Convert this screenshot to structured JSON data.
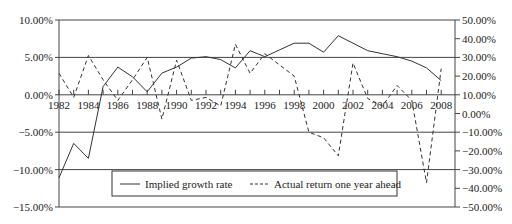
{
  "chart_data": {
    "type": "line",
    "title": "",
    "xlabel": "",
    "ylabel_left": "",
    "ylabel_right": "",
    "x": [
      1982,
      1983,
      1984,
      1985,
      1986,
      1987,
      1988,
      1989,
      1990,
      1991,
      1992,
      1993,
      1994,
      1995,
      1996,
      1997,
      1998,
      1999,
      2000,
      2001,
      2002,
      2003,
      2004,
      2005,
      2006,
      2007,
      2008
    ],
    "x_tick_labels": [
      "1982",
      "1984",
      "1986",
      "1988",
      "1990",
      "1992",
      "1994",
      "1996",
      "1998",
      "2000",
      "2002",
      "2004",
      "2006",
      "2008"
    ],
    "left_axis": {
      "ylim": [
        -15,
        10
      ],
      "tick_values": [
        10,
        5,
        0,
        -5,
        -10,
        -15
      ],
      "tick_labels": [
        "10.00%",
        "5.00%",
        "0.00%",
        "-5.00%",
        "-10.00%",
        "-15.00%"
      ]
    },
    "right_axis": {
      "ylim": [
        -50,
        50
      ],
      "tick_values": [
        50,
        40,
        30,
        20,
        10,
        0,
        -10,
        -20,
        -30,
        -40,
        -50
      ],
      "tick_labels": [
        "50.00%",
        "40.00%",
        "30.00%",
        "20.00%",
        "10.00%",
        "0.00%",
        "-10.00%",
        "-20.00%",
        "-30.00%",
        "-40.00%",
        "-50.00%"
      ]
    },
    "grid": true,
    "legend_position": "bottom-inside",
    "series": [
      {
        "name": "Implied growth rate",
        "axis": "left",
        "style": "solid",
        "values": [
          -11.1,
          -6.5,
          -8.5,
          1.1,
          3.7,
          2.4,
          0.4,
          2.9,
          3.7,
          4.9,
          5.1,
          4.7,
          3.6,
          5.9,
          5.1,
          6.0,
          6.9,
          6.9,
          5.7,
          7.9,
          6.9,
          5.9,
          5.5,
          5.1,
          4.5,
          3.6,
          1.9
        ]
      },
      {
        "name": "Actual return one year ahead",
        "axis": "right",
        "style": "dashed",
        "values": [
          21.5,
          8.6,
          31.0,
          18.0,
          7.0,
          18.0,
          30.0,
          -3.0,
          28.5,
          7.0,
          8.6,
          4.0,
          37.0,
          21.5,
          32.0,
          26.0,
          20.0,
          -10.0,
          -13.0,
          -22.6,
          27.0,
          8.0,
          4.0,
          15.0,
          7.0,
          -37.0,
          24.0
        ]
      }
    ]
  },
  "legend": {
    "items": [
      {
        "label": "Implied growth rate"
      },
      {
        "label": "Actual return one year ahead"
      }
    ]
  }
}
